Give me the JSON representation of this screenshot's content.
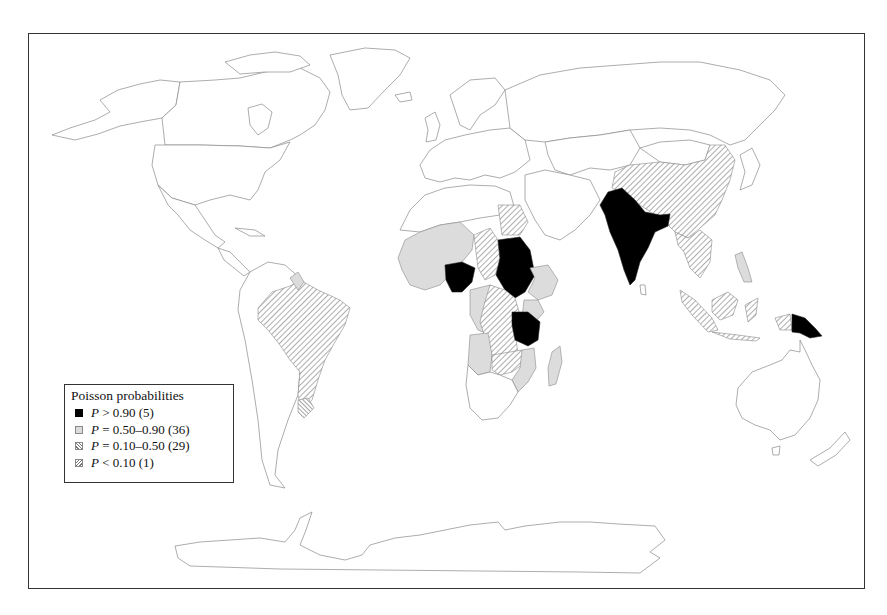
{
  "map": {
    "title": "",
    "projection": "world (Antarctica shown)",
    "colors": {
      "very_high": "#000000",
      "high": "#dcdcdc",
      "moderate_hatch": "#777777",
      "background": "#ffffff",
      "outline": "#8a8a8a"
    },
    "classified_regions": {
      "P>0.90": [
        "Nigeria",
        "Sudan",
        "Tanzania",
        "India",
        "Papua New Guinea"
      ],
      "P=0.50-0.90": [
        "Western African states",
        "Cameroon",
        "Ethiopia",
        "Kenya",
        "Angola",
        "Zambia",
        "Mozambique",
        "Madagascar",
        "Guyana",
        "Philippines"
      ],
      "P=0.10-0.50": [
        "Brazil",
        "China",
        "Chad",
        "Egypt",
        "Congo (DRC)",
        "Malawi",
        "Myanmar",
        "Thailand",
        "Indochina",
        "Indonesia"
      ],
      "P<0.10": [
        "Uruguay"
      ]
    }
  },
  "legend": {
    "title": "Poisson probabilities",
    "items": [
      {
        "symbol": "P",
        "text": " > 0.90 (5)",
        "swatch": "black"
      },
      {
        "symbol": "P",
        "text": " = 0.50–0.90 (36)",
        "swatch": "grey"
      },
      {
        "symbol": "P",
        "text": " = 0.10–0.50 (29)",
        "swatch": "hatch"
      },
      {
        "symbol": "P",
        "text": " < 0.10 (1)",
        "swatch": "hatch2"
      }
    ]
  }
}
